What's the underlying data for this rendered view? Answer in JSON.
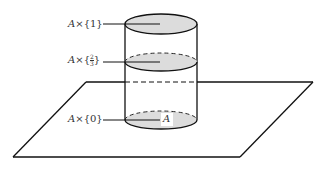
{
  "diagram": {
    "title": "",
    "labels": {
      "top": {
        "set": "A",
        "times": "×",
        "value": "{1}"
      },
      "middle": {
        "set": "A",
        "times": "×",
        "open": "{",
        "numerator": "2",
        "denominator": "3",
        "close": "}"
      },
      "bottom": {
        "set": "A",
        "times": "×",
        "value": "{0}"
      },
      "base_region": "A"
    },
    "colors": {
      "stroke": "#111111",
      "shading": "#dcdcdc",
      "background": "#ffffff"
    }
  }
}
